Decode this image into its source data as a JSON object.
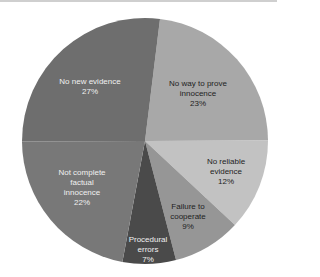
{
  "chart_data": {
    "type": "pie",
    "title": "",
    "start_angle_deg": 7,
    "direction": "clockwise",
    "slices": [
      {
        "label": "No way to prove innocence",
        "lines": [
          "No way to prove",
          "innocence"
        ],
        "value": 23,
        "pct_label": "23%",
        "color": "#a8a8a8",
        "text_color": "#1e1e1e",
        "lx": 198,
        "ly": 94
      },
      {
        "label": "No reliable evidence",
        "lines": [
          "No reliable",
          "evidence"
        ],
        "value": 12,
        "pct_label": "12%",
        "color": "#c2c2c2",
        "text_color": "#1e1e1e",
        "lx": 226,
        "ly": 172
      },
      {
        "label": "Failure to cooperate",
        "lines": [
          "Failure to",
          "cooperate"
        ],
        "value": 9,
        "pct_label": "9%",
        "color": "#969696",
        "text_color": "#1e1e1e",
        "lx": 188,
        "ly": 217
      },
      {
        "label": "Procedural errors",
        "lines": [
          "Procedural",
          "errors"
        ],
        "value": 7,
        "pct_label": "7%",
        "color": "#4a4a4a",
        "text_color": "#f0f0f0",
        "lx": 148,
        "ly": 250
      },
      {
        "label": "Not complete factual innocence",
        "lines": [
          "Not complete",
          "factual",
          "innocence"
        ],
        "value": 22,
        "pct_label": "22%",
        "color": "#787878",
        "text_color": "#f0f0f0",
        "lx": 82,
        "ly": 188
      },
      {
        "label": "No new evidence",
        "lines": [
          "No new evidence"
        ],
        "value": 27,
        "pct_label": "27%",
        "color": "#6e6e6e",
        "text_color": "#f0f0f0",
        "lx": 90,
        "ly": 87
      }
    ],
    "center": [
      145,
      141
    ],
    "radius": 123,
    "legend": "none"
  }
}
